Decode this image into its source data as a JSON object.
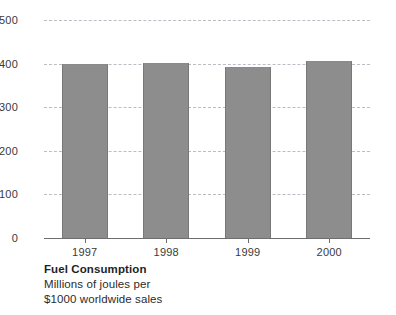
{
  "chart_data": {
    "type": "bar",
    "title": "Fuel Consumption",
    "xlabel": "",
    "ylabel": "",
    "categories": [
      "1997",
      "1998",
      "1999",
      "2000"
    ],
    "values": [
      400,
      402,
      392,
      407
    ],
    "ylim": [
      0,
      500
    ],
    "yticks": [
      0,
      100,
      200,
      300,
      400,
      500
    ],
    "ytick_labels": [
      "0",
      "100",
      "200",
      "300",
      "400",
      "500"
    ],
    "grid": true,
    "grid_style": "dashed",
    "legend": null,
    "series": [
      {
        "name": "Fuel Consumption",
        "values": [
          400,
          402,
          392,
          407
        ]
      }
    ],
    "bar_color": "#8d8d8d",
    "grid_color": "#b9bec4",
    "axis_color": "#6e6e6e"
  },
  "caption": {
    "title": "Fuel Consumption",
    "line1": "Millions of joules per",
    "line2": "$1000 worldwide sales"
  }
}
